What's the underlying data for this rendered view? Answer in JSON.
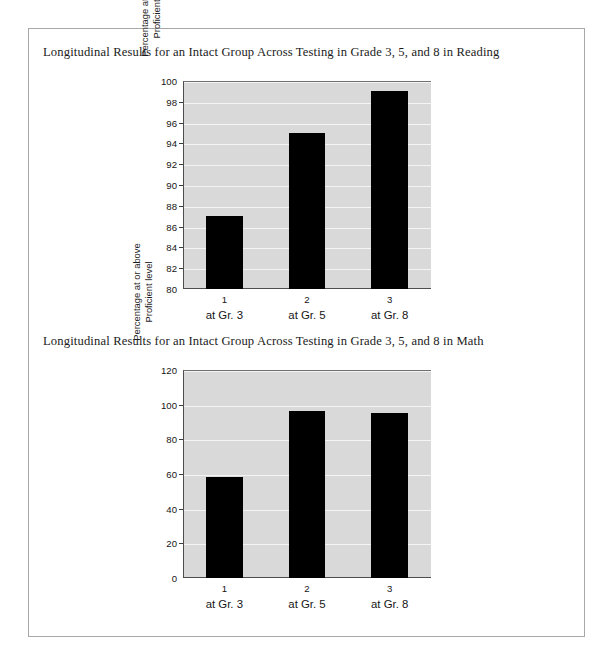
{
  "page": {
    "background": "#ffffff",
    "border_color": "#a8a8a8"
  },
  "figures": [
    {
      "id": "reading",
      "title": "Longitudinal Results for an Intact Group Across Testing in Grade 3, 5, and 8 in Reading"
    },
    {
      "id": "math",
      "title": "Longitudinal Results for an Intact Group Across Testing in Grade 3, 5, and 8 in Math"
    }
  ],
  "chart_data": [
    {
      "type": "bar",
      "id": "reading",
      "title": "Longitudinal Results for an Intact Group Across Testing in Grade 3, 5, and 8 in Reading",
      "categories": [
        "1",
        "2",
        "3"
      ],
      "category_sublabels": [
        "at Gr. 3",
        "at Gr. 5",
        "at Gr. 8"
      ],
      "values": [
        87,
        95,
        99
      ],
      "xlabel": "",
      "ylabel": "Percentage at or above\nProficient level",
      "ylim": [
        80,
        100
      ],
      "ytick_step": 2,
      "yticks": [
        80,
        82,
        84,
        86,
        88,
        90,
        92,
        94,
        96,
        98,
        100
      ],
      "ytick_labels": [
        "80",
        "82",
        "84",
        "86",
        "88",
        "90",
        "92",
        "94",
        "96",
        "98",
        "100"
      ],
      "grid": true,
      "legend": false,
      "bar_color": "#000000",
      "plot_background": "#d9d9d9",
      "gridline_color": "#f4f4f4"
    },
    {
      "type": "bar",
      "id": "math",
      "title": "Longitudinal Results for an Intact Group Across Testing in Grade 3, 5, and 8 in Math",
      "categories": [
        "1",
        "2",
        "3"
      ],
      "category_sublabels": [
        "at Gr. 3",
        "at Gr. 5",
        "at Gr. 8"
      ],
      "values": [
        58,
        96.5,
        95
      ],
      "xlabel": "",
      "ylabel": "Percentage at or above\nProficient level",
      "ylim": [
        0,
        120
      ],
      "ytick_step": 20,
      "yticks": [
        0,
        20,
        40,
        60,
        80,
        100,
        120
      ],
      "ytick_labels": [
        "0",
        "20",
        "40",
        "60",
        "80",
        "100",
        "120"
      ],
      "grid": true,
      "legend": false,
      "bar_color": "#000000",
      "plot_background": "#d9d9d9",
      "gridline_color": "#f4f4f4"
    }
  ]
}
